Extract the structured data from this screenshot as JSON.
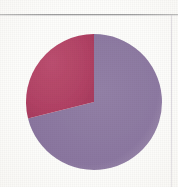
{
  "figure": {
    "title": "",
    "background_color": "#fdfdfb",
    "rule_color": "#8e8e90",
    "vertical_rule_color": "#b9b3c2"
  },
  "chart_data": {
    "type": "pie",
    "title": "",
    "subtitle": "",
    "xlabel": "",
    "ylabel": "",
    "legend": "none",
    "grid": false,
    "start_angle_deg": 90,
    "direction": "counterclockwise",
    "center": {
      "cx": 94,
      "cy": 102
    },
    "radius": 68,
    "labels": [
      "Segment 1",
      "Segment 2"
    ],
    "values": [
      31,
      69
    ],
    "value_unit": "%",
    "colors": [
      "#b24265",
      "#8b77a0"
    ],
    "slices": [
      {
        "label": "Segment 1",
        "value": 31,
        "color": "#b24265",
        "start_angle_deg": 90,
        "end_angle_deg": 194
      },
      {
        "label": "Segment 2",
        "value": 69,
        "color": "#8b77a0",
        "start_angle_deg": 194,
        "end_angle_deg": 450
      }
    ]
  },
  "accessibility": {
    "figure_description": "Two-slice pie chart: a raspberry-red slice of about 31 percent and a muted purple slice of about 69 percent."
  }
}
